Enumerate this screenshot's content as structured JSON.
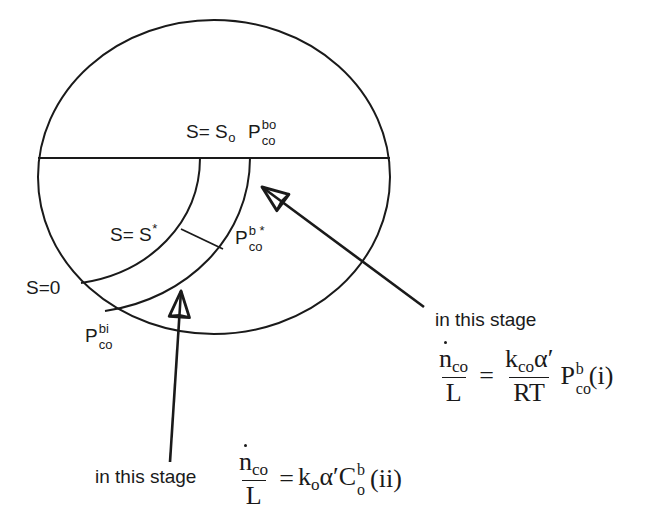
{
  "figure": {
    "background_color": "#ffffff",
    "line_color": "#1a1a1a"
  },
  "diagram_labels": {
    "s_outer": {
      "text": "S= S",
      "sub": "o"
    },
    "p_outer": {
      "base": "P",
      "sub": "co",
      "sup": "bo"
    },
    "s_star": {
      "text": "S= S",
      "sup": "*"
    },
    "p_star": {
      "base": "P",
      "sub": "co",
      "sup": "b *"
    },
    "s_zero": {
      "text": "S=0"
    },
    "p_inner": {
      "base": "P",
      "sub": "co",
      "sup": "bi"
    }
  },
  "annotations": {
    "stage_one_caption": "in this stage",
    "stage_two_caption": "in this stage"
  },
  "equations": {
    "eq_i": {
      "lhs_numerator": "n",
      "lhs_numerator_sub": "co",
      "lhs_denominator": "L",
      "operator": "=",
      "rhs_numerator": "k",
      "rhs_numerator_sub": "co",
      "rhs_numerator_alpha": "α′",
      "rhs_denominator": "RT",
      "rhs_tail_base": "P",
      "rhs_tail_sub": "co",
      "rhs_tail_sup": "b",
      "tag": "(i)"
    },
    "eq_ii": {
      "lhs_numerator": "n",
      "lhs_numerator_sub": "co",
      "lhs_denominator": "L",
      "operator": "=",
      "rhs_k": "k",
      "rhs_k_sub": "o",
      "rhs_alpha": "α′",
      "rhs_c": "C",
      "rhs_c_sub": "o",
      "rhs_c_sup": "b",
      "tag": "(ii)"
    }
  },
  "geometry": {
    "ellipse_center_x": 214,
    "ellipse_center_y": 177,
    "ellipse_rx": 176,
    "ellipse_ry": 157,
    "horizontal_line_y": 158
  }
}
